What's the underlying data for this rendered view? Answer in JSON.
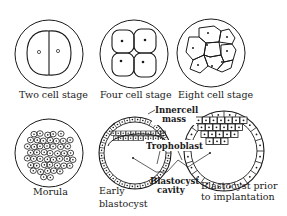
{
  "diagram": {
    "stages": [
      {
        "id": "two-cell",
        "label": "Two cell stage"
      },
      {
        "id": "four-cell",
        "label": "Four cell stage"
      },
      {
        "id": "eight-cell",
        "label": "Eight cell stage"
      },
      {
        "id": "morula",
        "label": "Morula"
      },
      {
        "id": "early-blastocyst",
        "label_lines": [
          "Early",
          "blastocyst"
        ]
      },
      {
        "id": "blastocyst-prior",
        "label_lines": [
          "Blastocyst prior",
          "to implantation"
        ]
      }
    ],
    "annotations": {
      "inner_cell_mass": [
        "Innercell",
        "mass"
      ],
      "trophoblast": "Trophoblast",
      "blastocyst_cavity": [
        "Blastocyst",
        "cavity"
      ]
    },
    "colors": {
      "ink": "#1a1a1a",
      "background": "#ffffff"
    }
  }
}
